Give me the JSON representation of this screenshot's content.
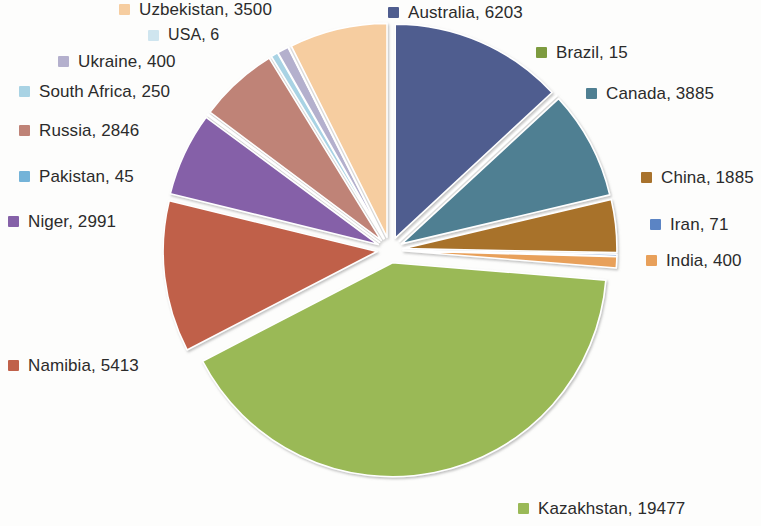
{
  "chart_data": {
    "type": "pie",
    "title": "",
    "subtitle": "",
    "xlabel": "",
    "ylabel": "",
    "legend_position": "around-pie",
    "grid": false,
    "total": 47387,
    "units": "tonnes",
    "exploded": true,
    "categories": [
      "Australia",
      "Brazil",
      "Canada",
      "China",
      "Iran",
      "India",
      "Kazakhstan",
      "Namibia",
      "Niger",
      "Pakistan",
      "Russia",
      "South Africa",
      "Ukraine",
      "USA",
      "Uzbekistan"
    ],
    "values": [
      6203,
      15,
      3885,
      1885,
      71,
      400,
      19477,
      5413,
      2991,
      45,
      2846,
      250,
      400,
      6,
      3500
    ],
    "colors": [
      "#4f5d8f",
      "#7d9b3f",
      "#4f7f92",
      "#a8722c",
      "#5b84c4",
      "#e8a05a",
      "#9ab957",
      "#c0614a",
      "#8561a8",
      "#74b3d8",
      "#bf8377",
      "#a9d3e4",
      "#b4b0cd",
      "#cfe5ef",
      "#f6cda0"
    ],
    "slices": [
      {
        "label": "Australia, 6203",
        "name": "Australia",
        "value": 6203,
        "color": "#4f5d8f"
      },
      {
        "label": "Brazil, 15",
        "name": "Brazil",
        "value": 15,
        "color": "#7d9b3f"
      },
      {
        "label": "Canada, 3885",
        "name": "Canada",
        "value": 3885,
        "color": "#4f7f92"
      },
      {
        "label": "China, 1885",
        "name": "China",
        "value": 1885,
        "color": "#a8722c"
      },
      {
        "label": "Iran, 71",
        "name": "Iran",
        "value": 71,
        "color": "#5b84c4"
      },
      {
        "label": "India, 400",
        "name": "India",
        "value": 400,
        "color": "#e8a05a"
      },
      {
        "label": "Kazakhstan, 19477",
        "name": "Kazakhstan",
        "value": 19477,
        "color": "#9ab957"
      },
      {
        "label": "Namibia, 5413",
        "name": "Namibia",
        "value": 5413,
        "color": "#c0614a"
      },
      {
        "label": "Niger, 2991",
        "name": "Niger",
        "value": 2991,
        "color": "#8561a8"
      },
      {
        "label": "Pakistan, 45",
        "name": "Pakistan",
        "value": 45,
        "color": "#74b3d8"
      },
      {
        "label": "Russia, 2846",
        "name": "Russia",
        "value": 2846,
        "color": "#bf8377"
      },
      {
        "label": "South Africa, 250",
        "name": "South Africa",
        "value": 250,
        "color": "#a9d3e4"
      },
      {
        "label": "Ukraine, 400",
        "name": "Ukraine",
        "value": 400,
        "color": "#b4b0cd"
      },
      {
        "label": "USA, 6",
        "name": "USA",
        "value": 6,
        "color": "#cfe5ef"
      },
      {
        "label": "Uzbekistan, 3500",
        "name": "Uzbekistan",
        "value": 3500,
        "color": "#f6cda0"
      }
    ]
  },
  "legend": {
    "australia": "Australia, 6203",
    "brazil": "Brazil, 15",
    "canada": "Canada, 3885",
    "china": "China, 1885",
    "iran": "Iran, 71",
    "india": "India, 400",
    "kazakhstan": "Kazakhstan, 19477",
    "namibia": "Namibia, 5413",
    "niger": "Niger, 2991",
    "pakistan": "Pakistan, 45",
    "russia": "Russia, 2846",
    "south_africa": "South Africa, 250",
    "ukraine": "Ukraine, 400",
    "usa": "USA, 6",
    "uzbekistan": "Uzbekistan, 3500"
  }
}
